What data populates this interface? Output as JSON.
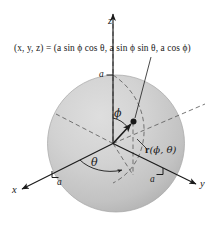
{
  "figure": {
    "equation": {
      "lhs": "(x, y, z)",
      "equals": "=",
      "rhs": "(a sin ϕ cos θ, a sin ϕ sin θ, a cos ϕ)",
      "full": "(x, y, z) = (a sin ϕ cos θ, a sin ϕ sin θ, a cos ϕ)"
    },
    "axes": [
      {
        "name": "z-axis",
        "label": "z",
        "direction": "up"
      },
      {
        "name": "x-axis",
        "label": "x",
        "direction": "down-left"
      },
      {
        "name": "y-axis",
        "label": "y",
        "direction": "down-right"
      }
    ],
    "tick_labels": [
      {
        "name": "z-radius-tick",
        "label": "a",
        "axis": "z"
      },
      {
        "name": "x-radius-tick",
        "label": "a",
        "axis": "x"
      },
      {
        "name": "y-radius-tick",
        "label": "a",
        "axis": "y"
      }
    ],
    "angles": [
      {
        "name": "phi-angle",
        "label": "ϕ",
        "from": "z-axis",
        "to": "radius-vector"
      },
      {
        "name": "theta-angle",
        "label": "θ",
        "from": "x-axis",
        "to": "projection"
      }
    ],
    "vector": {
      "name": "radius-vector",
      "symbol": "r",
      "args": "(ϕ, θ)",
      "label": "r(ϕ, θ)"
    },
    "sphere": {
      "name": "sphere-body",
      "radius_label": "a"
    },
    "colors": {
      "sphere_fill_light": "#d2d2d2",
      "sphere_fill_dark": "#b4b4b4",
      "sphere_edge": "#9a9a9a",
      "ink": "#1a1a1a",
      "dash": "#6e6e6e",
      "background": "#ffffff"
    }
  }
}
